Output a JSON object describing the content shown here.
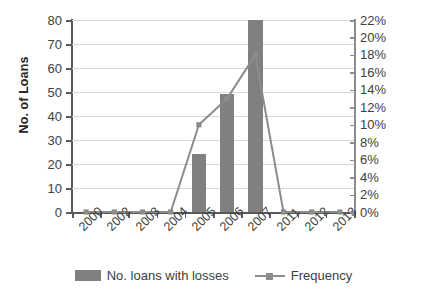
{
  "chart_data": {
    "type": "bar",
    "title": "",
    "xlabel": "",
    "ylabel": "No. of Loans",
    "y2label": "",
    "categories": [
      "2000",
      "2002",
      "2003",
      "2004",
      "2005",
      "2006",
      "2007",
      "2011",
      "2012",
      "2013"
    ],
    "ylim": [
      0,
      80
    ],
    "yticks": [
      0,
      10,
      20,
      30,
      40,
      50,
      60,
      70,
      80
    ],
    "ytick_labels": [
      "0",
      "10",
      "20",
      "30",
      "40",
      "50",
      "60",
      "70",
      "80"
    ],
    "y2lim": [
      0,
      22
    ],
    "y2ticks": [
      0,
      2,
      4,
      6,
      8,
      10,
      12,
      14,
      16,
      18,
      20,
      22
    ],
    "y2tick_labels": [
      "0%",
      "2%",
      "4%",
      "6%",
      "8%",
      "10%",
      "12%",
      "14%",
      "16%",
      "18%",
      "20%",
      "22%"
    ],
    "grid": true,
    "legend_position": "bottom",
    "series": [
      {
        "name": "No. loans with losses",
        "type": "bar",
        "axis": "left",
        "color": "#808080",
        "values": [
          0,
          0,
          0,
          0,
          24,
          49,
          80,
          0,
          0,
          0
        ]
      },
      {
        "name": "Frequency",
        "type": "line",
        "axis": "right",
        "color": "#8c8c8c",
        "values": [
          0,
          0,
          0,
          0,
          10,
          13,
          18,
          0,
          0,
          0
        ]
      }
    ]
  },
  "legend": {
    "items": [
      {
        "label": "No. loans with losses"
      },
      {
        "label": "Frequency"
      }
    ]
  }
}
